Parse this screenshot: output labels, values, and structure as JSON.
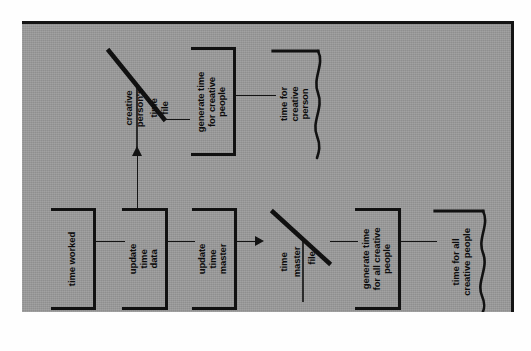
{
  "figure": {
    "kind": "data-flow-diagram",
    "orientation": "rotated-90-ccw",
    "page_background": "#9b9b9b",
    "ink_color": "#111111"
  },
  "nodes": {
    "time_worked": {
      "type": "process",
      "label": "time worked",
      "lines": [
        "time worked"
      ]
    },
    "update_time_data": {
      "type": "process",
      "label": "update time data",
      "lines": [
        "update",
        "time",
        "data"
      ]
    },
    "update_time_master": {
      "type": "process",
      "label": "update time master",
      "lines": [
        "update",
        "time",
        "master"
      ]
    },
    "generate_time_for_creative_people": {
      "type": "process",
      "label": "generate time for creative people",
      "lines": [
        "generate time",
        "for creative",
        "people"
      ]
    },
    "generate_time_for_all_creative_people": {
      "type": "process",
      "label": "generate time for all creative people",
      "lines": [
        "generate time",
        "for all creative",
        "people"
      ]
    },
    "creative_persons_time_file": {
      "type": "data-store",
      "label": "creative person's time file",
      "lines": [
        "creative",
        "person's",
        "time",
        "file"
      ]
    },
    "time_master_file": {
      "type": "data-store",
      "label": "time master file",
      "lines": [
        "time",
        "master",
        "file"
      ]
    },
    "time_for_creative_person": {
      "type": "document",
      "label": "time for creative person",
      "lines": [
        "time for",
        "creative",
        "person"
      ]
    },
    "time_for_all_creative_people": {
      "type": "document",
      "label": "time for all creative people",
      "lines": [
        "time for all",
        "creative people"
      ]
    }
  },
  "flows": [
    {
      "from": "time_worked",
      "to": "update_time_data",
      "arrow": false
    },
    {
      "from": "update_time_data",
      "to": "update_time_master",
      "arrow": false
    },
    {
      "from": "update_time_data",
      "to": "creative_persons_time_file",
      "arrow": true,
      "direction": "up"
    },
    {
      "from": "update_time_master",
      "to": "time_master_file",
      "arrow": true,
      "direction": "right"
    },
    {
      "from": "time_master_file",
      "to": "generate_time_for_all_creative_people",
      "arrow": false
    },
    {
      "from": "generate_time_for_all_creative_people",
      "to": "time_for_all_creative_people",
      "arrow": false
    },
    {
      "from": "creative_persons_time_file",
      "to": "generate_time_for_creative_people",
      "arrow": false
    },
    {
      "from": "generate_time_for_creative_people",
      "to": "time_for_creative_person",
      "arrow": false
    }
  ]
}
